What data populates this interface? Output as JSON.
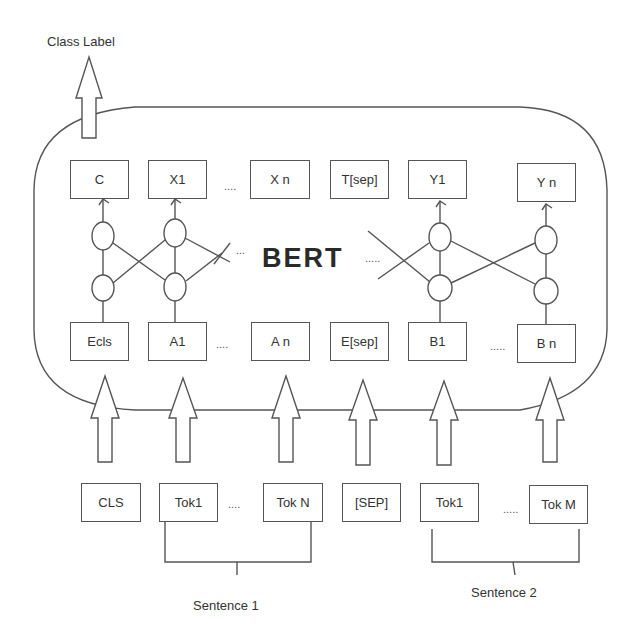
{
  "diagram": {
    "title_output": "Class Label",
    "model_name": "BERT",
    "output_tokens": [
      "C",
      "X1",
      "X n",
      "T[sep]",
      "Y1",
      "Y n"
    ],
    "embedding_tokens": [
      "Ecls",
      "A1",
      "A n",
      "E[sep]",
      "B1",
      "B n"
    ],
    "input_tokens": [
      "CLS",
      "Tok1",
      "Tok N",
      "[SEP]",
      "Tok1",
      "Tok M"
    ],
    "ellipsis": {
      "output_a": "....",
      "embed_a": "....",
      "embed_b": ".....",
      "input_a": "....",
      "input_b": ".....",
      "bert_left": "...",
      "bert_right": "....."
    },
    "groups": {
      "sentence1": "Sentence 1",
      "sentence2": "Sentence 2"
    },
    "colors": {
      "stroke": "#555555",
      "text": "#333333",
      "background": "#ffffff"
    }
  }
}
